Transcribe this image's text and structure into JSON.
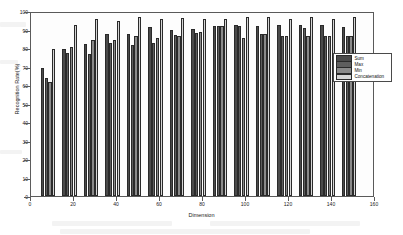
{
  "chart_data": {
    "type": "bar",
    "title": "",
    "xlabel": "Dimension",
    "ylabel": "Recognition Rate(%)",
    "xlim": [
      0,
      160
    ],
    "ylim": [
      0,
      100
    ],
    "xticks": [
      0,
      20,
      40,
      60,
      80,
      100,
      120,
      140,
      160
    ],
    "yticks": [
      0,
      10,
      20,
      30,
      40,
      50,
      60,
      70,
      80,
      90,
      100
    ],
    "grid": false,
    "legend_position": "center-right",
    "categories": [
      8,
      18,
      28,
      38,
      48,
      58,
      68,
      78,
      88,
      98,
      108,
      118,
      128,
      138,
      148
    ],
    "series": [
      {
        "name": "Sum",
        "color": "#4a4a4a",
        "values": [
          69.8,
          80.3,
          83.3,
          88.5,
          88.4,
          92.6,
          90.8,
          91.5,
          92.7,
          93.5,
          92.8,
          93.4,
          93.4,
          93.4,
          92.5
        ]
      },
      {
        "name": "Max",
        "color": "#5e5e5e",
        "values": [
          64.6,
          78.0,
          77.5,
          83.4,
          82.5,
          83.5,
          88.2,
          89.3,
          92.7,
          92.7,
          88.6,
          87.6,
          91.9,
          87.3,
          87.3
        ]
      },
      {
        "name": "Min",
        "color": "#8a8a8a",
        "values": [
          62.3,
          81.3,
          85.4,
          85.1,
          87.4,
          86.2,
          87.6,
          89.5,
          92.7,
          86.5,
          88.5,
          87.6,
          87.4,
          87.3,
          87.3
        ]
      },
      {
        "name": "Concatenation",
        "color": "#d6d6d6",
        "values": [
          80.3,
          93.6,
          96.9,
          95.9,
          98.0,
          96.9,
          97.5,
          96.8,
          96.6,
          97.9,
          97.9,
          96.7,
          97.9,
          96.6,
          97.7
        ]
      }
    ]
  },
  "legend": {
    "entries": [
      {
        "label": "Sum"
      },
      {
        "label": "Max"
      },
      {
        "label": "Min"
      },
      {
        "label": "Concatenation"
      }
    ]
  }
}
